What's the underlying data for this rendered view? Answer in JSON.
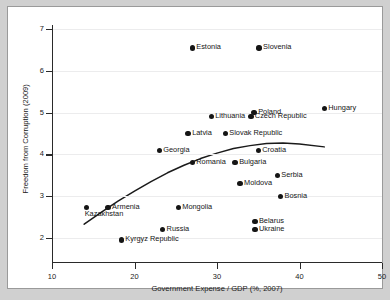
{
  "chart_data": {
    "type": "scatter",
    "title": "",
    "xlabel": "Government Expense / GDP (%, 2007)",
    "ylabel": "Freedom from Corruption (2009)",
    "xlim": [
      10,
      50
    ],
    "ylim": [
      1.75,
      7.2
    ],
    "xticks": [
      10,
      20,
      30,
      40,
      50
    ],
    "yticks": [
      2,
      3,
      4,
      5,
      6,
      7
    ],
    "xtick_labels": [
      "10",
      "20",
      "30",
      "40",
      "50"
    ],
    "ytick_labels": [
      "2",
      "3",
      "4",
      "5",
      "6",
      "7"
    ],
    "grid": true,
    "legend": "none",
    "marker_color": "#151515",
    "fit_line_color": "#1a1a1a",
    "background_color": "#ffffff",
    "figure_background_color": "#d0d0d0",
    "points": [
      {
        "label": "Estonia",
        "x": 27.0,
        "y": 6.55,
        "label_pos": "right"
      },
      {
        "label": "Slovenia",
        "x": 35.1,
        "y": 6.55,
        "label_pos": "right"
      },
      {
        "label": "Hungary",
        "x": 43.0,
        "y": 5.1,
        "label_pos": "right"
      },
      {
        "label": "Poland",
        "x": 34.5,
        "y": 5.0,
        "label_pos": "right"
      },
      {
        "label": "Czech Republic",
        "x": 34.1,
        "y": 4.9,
        "label_pos": "right"
      },
      {
        "label": "Lithuania",
        "x": 29.3,
        "y": 4.9,
        "label_pos": "right"
      },
      {
        "label": "Latvia",
        "x": 26.5,
        "y": 4.5,
        "label_pos": "right"
      },
      {
        "label": "Slovak Republic",
        "x": 31.0,
        "y": 4.5,
        "label_pos": "right"
      },
      {
        "label": "Georgia",
        "x": 23.0,
        "y": 4.1,
        "label_pos": "right"
      },
      {
        "label": "Croatia",
        "x": 35.0,
        "y": 4.1,
        "label_pos": "right"
      },
      {
        "label": "Romania",
        "x": 27.0,
        "y": 3.8,
        "label_pos": "right"
      },
      {
        "label": "Bulgaria",
        "x": 32.2,
        "y": 3.8,
        "label_pos": "right"
      },
      {
        "label": "Serbia",
        "x": 37.3,
        "y": 3.5,
        "label_pos": "right"
      },
      {
        "label": "Moldova",
        "x": 32.8,
        "y": 3.3,
        "label_pos": "right"
      },
      {
        "label": "Bosnia",
        "x": 37.7,
        "y": 3.0,
        "label_pos": "right"
      },
      {
        "label": "Armenia",
        "x": 16.8,
        "y": 2.73,
        "label_pos": "right"
      },
      {
        "label": "Kazakhstan",
        "x": 14.2,
        "y": 2.73,
        "label_pos": "below"
      },
      {
        "label": "Mongolia",
        "x": 25.3,
        "y": 2.73,
        "label_pos": "right"
      },
      {
        "label": "Belarus",
        "x": 34.6,
        "y": 2.4,
        "label_pos": "right"
      },
      {
        "label": "Russia",
        "x": 23.4,
        "y": 2.2,
        "label_pos": "right"
      },
      {
        "label": "Ukraine",
        "x": 34.6,
        "y": 2.2,
        "label_pos": "right"
      },
      {
        "label": "Kyrgyz Republic",
        "x": 18.4,
        "y": 1.95,
        "label_pos": "right"
      }
    ],
    "fit_curve": {
      "type": "quadratic-fit",
      "points": [
        {
          "x": 13.9,
          "y": 2.33
        },
        {
          "x": 16.0,
          "y": 2.62
        },
        {
          "x": 18.0,
          "y": 2.88
        },
        {
          "x": 20.0,
          "y": 3.12
        },
        {
          "x": 22.0,
          "y": 3.35
        },
        {
          "x": 24.0,
          "y": 3.56
        },
        {
          "x": 26.0,
          "y": 3.74
        },
        {
          "x": 28.0,
          "y": 3.9
        },
        {
          "x": 30.0,
          "y": 4.03
        },
        {
          "x": 32.0,
          "y": 4.14
        },
        {
          "x": 34.0,
          "y": 4.21
        },
        {
          "x": 36.0,
          "y": 4.26
        },
        {
          "x": 38.0,
          "y": 4.27
        },
        {
          "x": 40.0,
          "y": 4.25
        },
        {
          "x": 43.0,
          "y": 4.18
        }
      ]
    }
  }
}
